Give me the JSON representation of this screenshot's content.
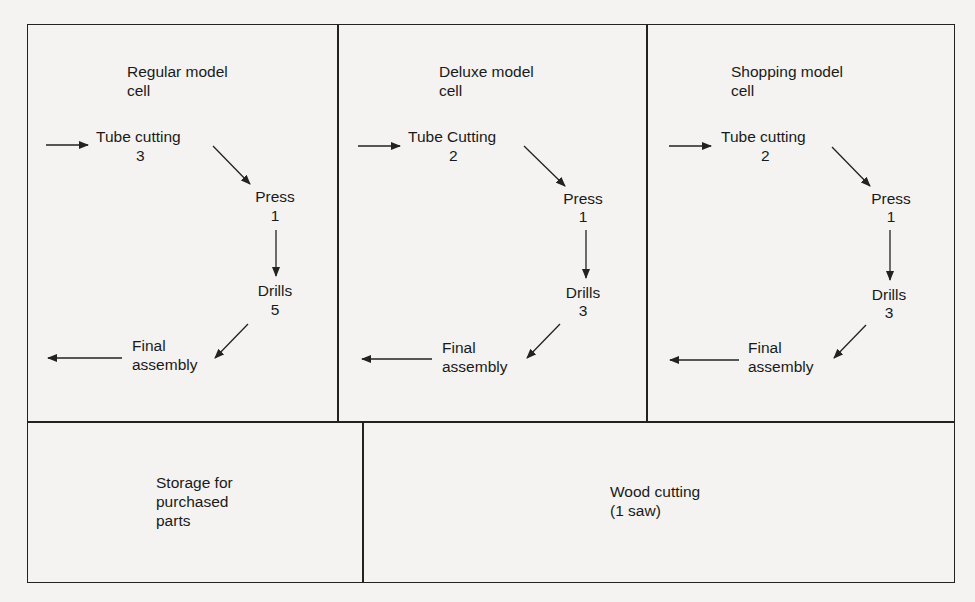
{
  "cells": [
    {
      "title": [
        "Regular model",
        "cell"
      ],
      "steps": [
        {
          "name": "Tube cutting",
          "count": "3"
        },
        {
          "name": "Press",
          "count": "1"
        },
        {
          "name": "Drills",
          "count": "5"
        },
        {
          "name": "Final",
          "count": "assembly"
        }
      ]
    },
    {
      "title": [
        "Deluxe model",
        "cell"
      ],
      "steps": [
        {
          "name": "Tube Cutting",
          "count": "2"
        },
        {
          "name": "Press",
          "count": "1"
        },
        {
          "name": "Drills",
          "count": "3"
        },
        {
          "name": "Final",
          "count": "assembly"
        }
      ]
    },
    {
      "title": [
        "Shopping model",
        "cell"
      ],
      "steps": [
        {
          "name": "Tube cutting",
          "count": "2"
        },
        {
          "name": "Press",
          "count": "1"
        },
        {
          "name": "Drills",
          "count": "3"
        },
        {
          "name": "Final",
          "count": "assembly"
        }
      ]
    }
  ],
  "storage": {
    "lines": [
      "Storage for",
      "purchased",
      "parts"
    ]
  },
  "wood": {
    "lines": [
      "Wood cutting",
      "(1 saw)"
    ]
  },
  "colors": {
    "line": "#222222",
    "background": "#f4f3f1"
  }
}
